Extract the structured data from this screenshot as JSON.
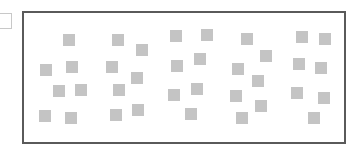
{
  "side_box": {
    "value": ""
  },
  "canvas": {
    "border_color": "#5a5a5a",
    "square_color": "#c4c4c4",
    "square_size": 12,
    "squares": [
      {
        "x": 63,
        "y": 34
      },
      {
        "x": 40,
        "y": 64
      },
      {
        "x": 66,
        "y": 61
      },
      {
        "x": 53,
        "y": 85
      },
      {
        "x": 75,
        "y": 84
      },
      {
        "x": 39,
        "y": 110
      },
      {
        "x": 65,
        "y": 112
      },
      {
        "x": 112,
        "y": 34
      },
      {
        "x": 136,
        "y": 44
      },
      {
        "x": 106,
        "y": 61
      },
      {
        "x": 131,
        "y": 72
      },
      {
        "x": 113,
        "y": 84
      },
      {
        "x": 110,
        "y": 109
      },
      {
        "x": 132,
        "y": 104
      },
      {
        "x": 170,
        "y": 30
      },
      {
        "x": 201,
        "y": 29
      },
      {
        "x": 194,
        "y": 53
      },
      {
        "x": 171,
        "y": 60
      },
      {
        "x": 191,
        "y": 83
      },
      {
        "x": 168,
        "y": 89
      },
      {
        "x": 185,
        "y": 108
      },
      {
        "x": 241,
        "y": 33
      },
      {
        "x": 260,
        "y": 50
      },
      {
        "x": 232,
        "y": 63
      },
      {
        "x": 252,
        "y": 75
      },
      {
        "x": 230,
        "y": 90
      },
      {
        "x": 255,
        "y": 100
      },
      {
        "x": 236,
        "y": 112
      },
      {
        "x": 296,
        "y": 31
      },
      {
        "x": 319,
        "y": 33
      },
      {
        "x": 293,
        "y": 58
      },
      {
        "x": 315,
        "y": 62
      },
      {
        "x": 291,
        "y": 87
      },
      {
        "x": 318,
        "y": 92
      },
      {
        "x": 308,
        "y": 112
      }
    ]
  }
}
